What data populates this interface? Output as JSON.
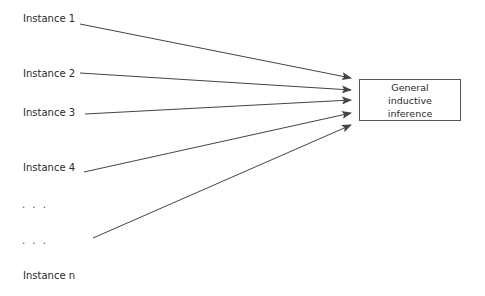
{
  "diagram": {
    "instances": [
      {
        "label": "Instance 1",
        "x": 23,
        "y": 14,
        "line": [
          80,
          24,
          351,
          78
        ]
      },
      {
        "label": "Instance 2",
        "x": 23,
        "y": 69,
        "line": [
          80,
          73,
          351,
          90
        ]
      },
      {
        "label": "Instance 3",
        "x": 23,
        "y": 108,
        "line": [
          85,
          114,
          351,
          100
        ]
      },
      {
        "label": "Instance 4",
        "x": 23,
        "y": 163,
        "line": [
          84,
          172,
          351,
          113
        ]
      },
      {
        "label": "Instance n",
        "x": 23,
        "y": 239,
        "line": [
          93,
          238,
          351,
          125
        ]
      }
    ],
    "ellipses": [
      {
        "text": ". . .",
        "x": 23,
        "y": 201
      },
      {
        "text": ". . .",
        "x": 23,
        "y": 237
      }
    ],
    "target": {
      "lines": [
        "General",
        "inductive",
        "inference"
      ]
    },
    "colors": {
      "line": "#444444",
      "border": "#555555",
      "text": "#2a2a2a"
    }
  }
}
